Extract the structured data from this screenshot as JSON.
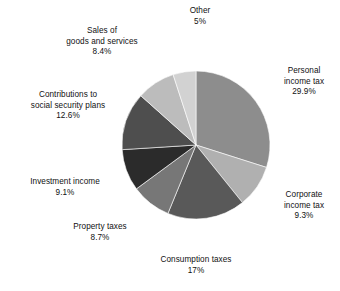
{
  "chart_data": {
    "type": "pie",
    "title": "",
    "subtitle": "",
    "xlabel": "",
    "ylabel": "",
    "legend_position": "none",
    "grid": false,
    "units": "percent",
    "start_angle_deg": 0,
    "direction": "clockwise",
    "categories": [
      "Personal income tax",
      "Corporate income tax",
      "Consumption taxes",
      "Property taxes",
      "Investment income",
      "Contributions to social security plans",
      "Sales of goods and services",
      "Other"
    ],
    "values": [
      29.9,
      9.3,
      17,
      8.7,
      9.1,
      12.6,
      8.4,
      5
    ],
    "value_labels": [
      "29.9%",
      "9.3%",
      "17%",
      "8.7%",
      "9.1%",
      "12.6%",
      "8.4%",
      "5%"
    ],
    "colors": [
      "#8d8d8d",
      "#b0b0b0",
      "#595959",
      "#777777",
      "#2b2b2b",
      "#4e4e4e",
      "#bcbcbc",
      "#d2d2d2"
    ],
    "slices": [
      {
        "name": "Personal income tax",
        "label_lines": [
          "Personal",
          "income tax"
        ],
        "value_label": "29.9%",
        "value": 29.9,
        "color": "#8d8d8d"
      },
      {
        "name": "Corporate income tax",
        "label_lines": [
          "Corporate",
          "income tax"
        ],
        "value_label": "9.3%",
        "value": 9.3,
        "color": "#b0b0b0"
      },
      {
        "name": "Consumption taxes",
        "label_lines": [
          "Consumption taxes"
        ],
        "value_label": "17%",
        "value": 17,
        "color": "#595959"
      },
      {
        "name": "Property taxes",
        "label_lines": [
          "Property taxes"
        ],
        "value_label": "8.7%",
        "value": 8.7,
        "color": "#777777"
      },
      {
        "name": "Investment income",
        "label_lines": [
          "Investment income"
        ],
        "value_label": "9.1%",
        "value": 9.1,
        "color": "#2b2b2b"
      },
      {
        "name": "Contributions to social security plans",
        "label_lines": [
          "Contributions to",
          "social security plans"
        ],
        "value_label": "12.6%",
        "value": 12.6,
        "color": "#4e4e4e"
      },
      {
        "name": "Sales of goods and services",
        "label_lines": [
          "Sales of",
          "goods and services"
        ],
        "value_label": "8.4%",
        "value": 8.4,
        "color": "#bcbcbc"
      },
      {
        "name": "Other",
        "label_lines": [
          "Other"
        ],
        "value_label": "5%",
        "value": 5,
        "color": "#d2d2d2"
      }
    ]
  },
  "geometry": {
    "center_x": 196,
    "center_y": 145,
    "radius": 74
  }
}
